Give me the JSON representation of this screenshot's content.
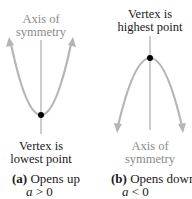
{
  "panel_a": {
    "axis_label_line1": "Axis of",
    "axis_label_line2": "symmetry",
    "vertex_label_line1": "Vertex is",
    "vertex_label_line2": "lowest point",
    "caption_letter": "(a)",
    "caption_text": " Opens up",
    "condition_var": "a",
    "condition_rest": " > 0"
  },
  "panel_b": {
    "vertex_label_line1": "Vertex is",
    "vertex_label_line2": "highest point",
    "axis_label_line1": "Axis of",
    "axis_label_line2": "symmetry",
    "caption_letter": "(b)",
    "caption_text": " Opens down",
    "condition_var": "a",
    "condition_rest": " < 0"
  },
  "colors": {
    "curve": "#b5b5b5",
    "axis": "#9a9a9a",
    "vertex": "#000000",
    "gray_text": "#8a8a8a"
  }
}
